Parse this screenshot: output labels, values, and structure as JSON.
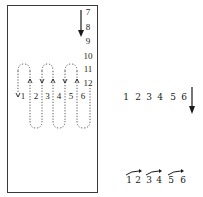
{
  "figure": {
    "left_panel": {
      "column_numbers": [
        "7",
        "8",
        "9",
        "10",
        "11",
        "12"
      ],
      "row_numbers": [
        "1",
        "2",
        "3",
        "4",
        "5",
        "6"
      ],
      "arrow_marks": {
        "down_marker": "v",
        "up_marker": "A"
      },
      "description": "serpentine dotted reading path through 1–6, with column 7–12 read downward"
    },
    "right_panel": {
      "middle_row_numbers": [
        "1",
        "2",
        "3",
        "4",
        "5",
        "6"
      ],
      "bottom_row_numbers": [
        "1",
        "2",
        "3",
        "4",
        "5",
        "6"
      ],
      "description": "row 1–6 followed by downward arrow; bottom row with pairwise arrows 1→2, 3→4, 5→6"
    },
    "colors": {
      "ink": "#1a1a1a",
      "border": "#3a3a3a",
      "background": "#ffffff"
    }
  }
}
